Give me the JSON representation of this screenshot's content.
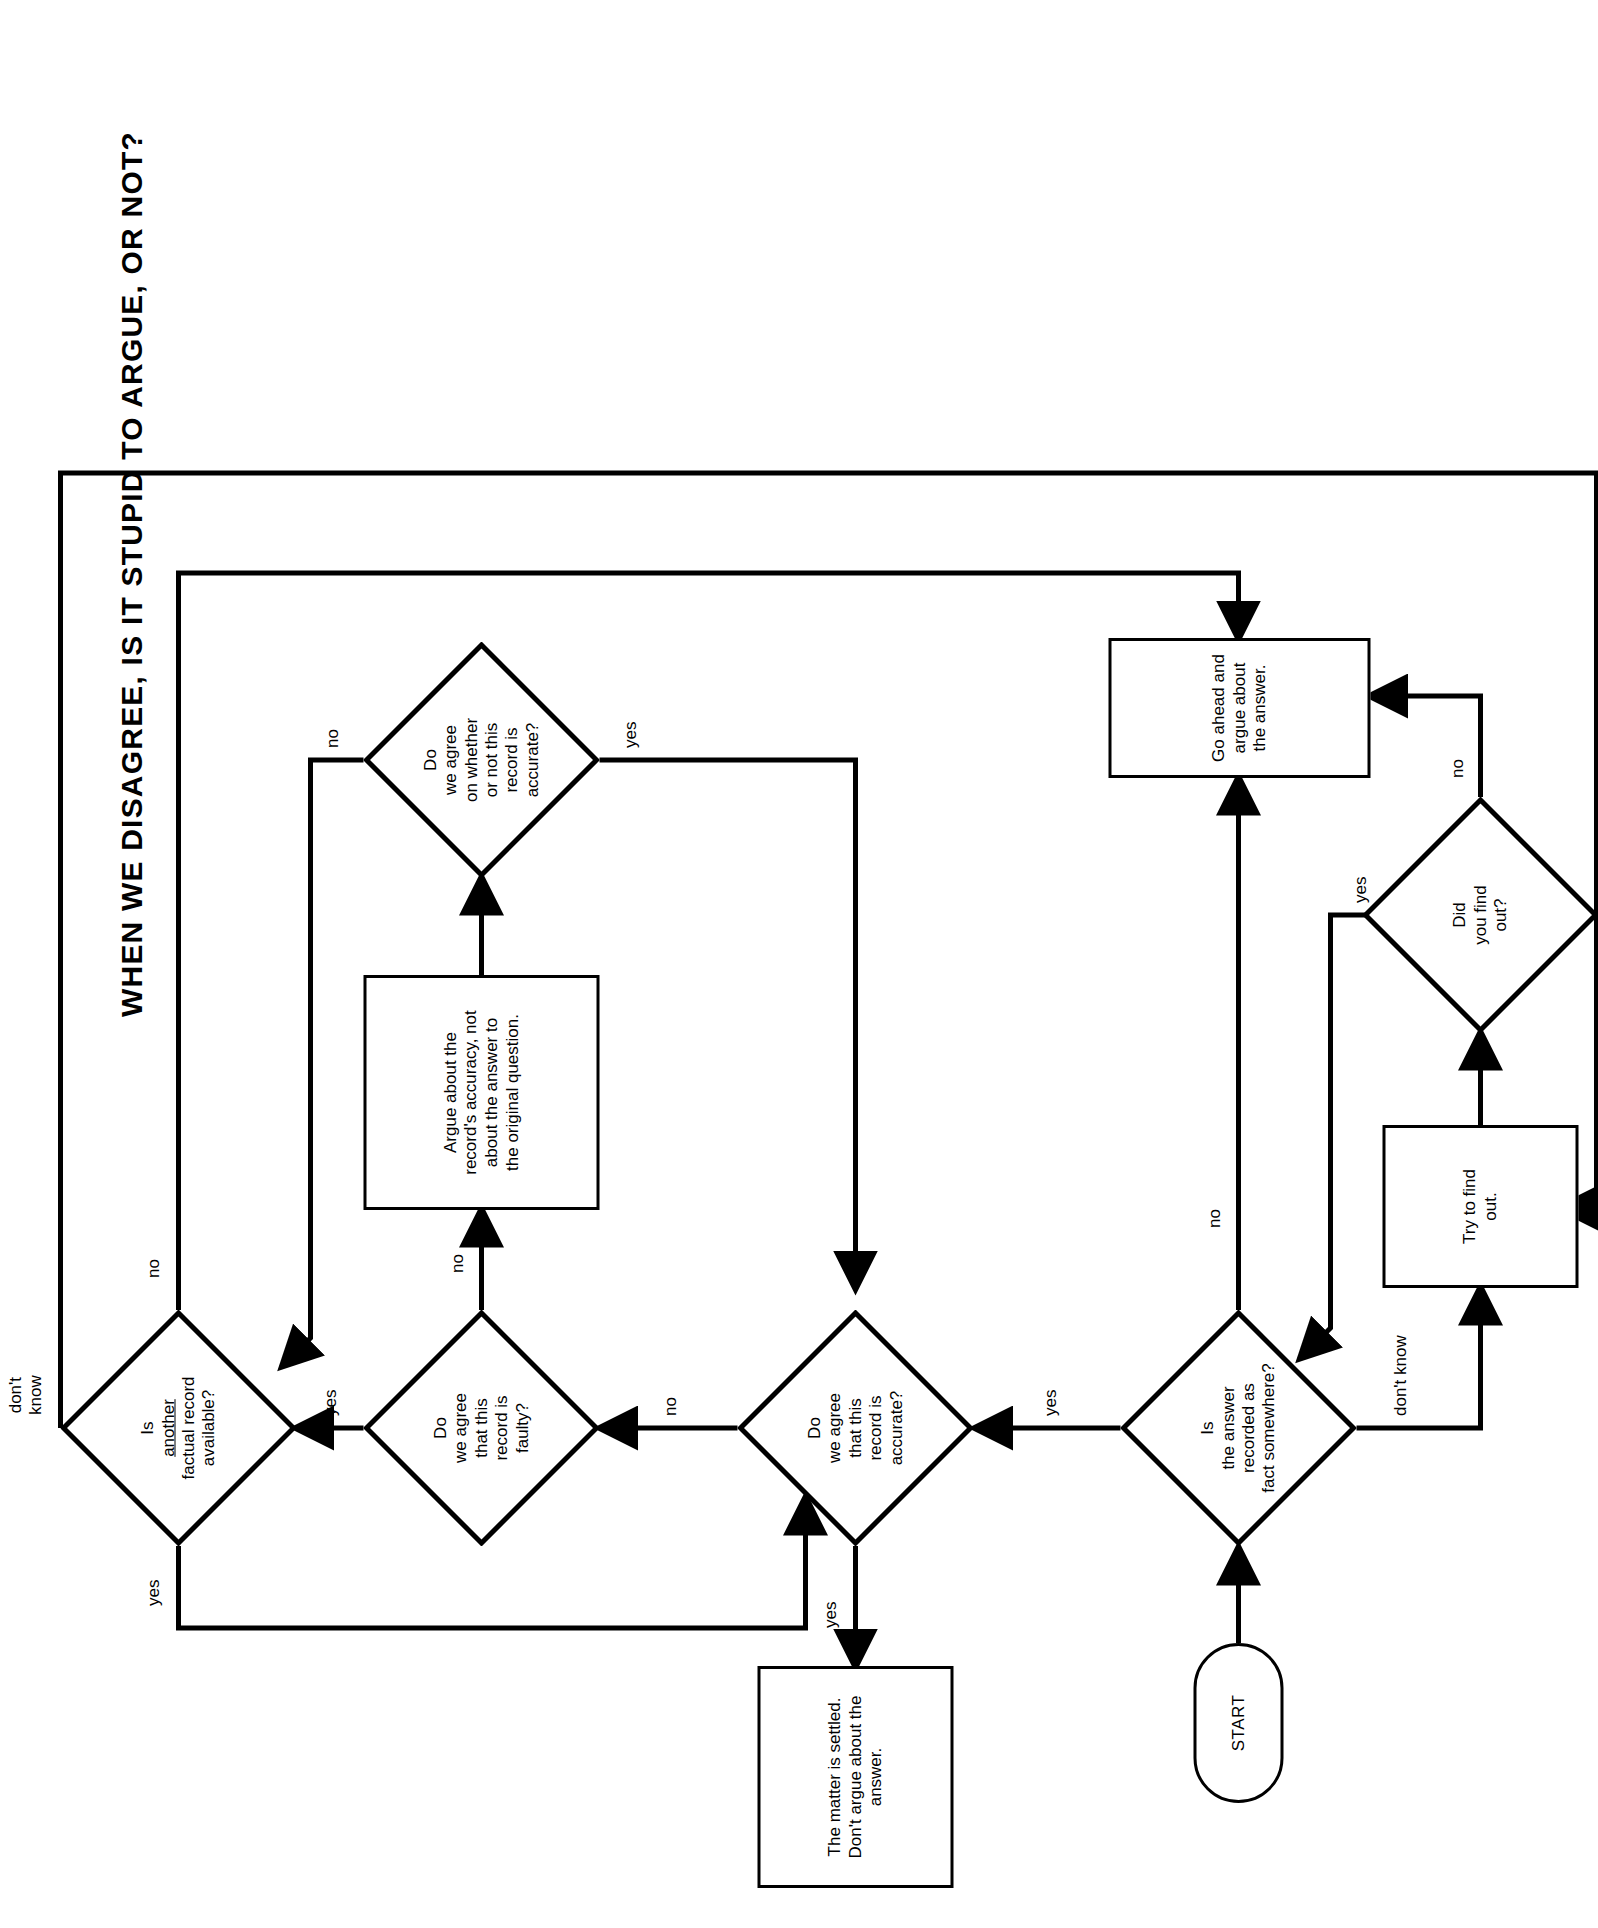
{
  "title": "WHEN WE DISAGREE,  IS IT  STUPID  TO  ARGUE, OR NOT?",
  "nodes": {
    "start": {
      "label": "START",
      "shape": "terminal"
    },
    "recorded": {
      "line1": "Is",
      "line2": "the answer",
      "line3": "recorded as",
      "line4": "fact somewhere?",
      "shape": "decision"
    },
    "try_find": {
      "line1": "Try to find",
      "line2": "out.",
      "shape": "process"
    },
    "did_find": {
      "line1": "Did",
      "line2": "you find",
      "line3": "out?",
      "shape": "decision"
    },
    "go_argue": {
      "line1": "Go ahead and",
      "line2": "argue about",
      "line3": "the answer.",
      "shape": "process"
    },
    "agree_accurate": {
      "line1": "Do",
      "line2": "we agree",
      "line3": "that this",
      "line4": "record is",
      "line5": "accurate?",
      "shape": "decision"
    },
    "settled": {
      "line1": "The matter is settled.",
      "line2": "Don't argue about the",
      "line3": "answer.",
      "shape": "process"
    },
    "agree_faulty": {
      "line1": "Do",
      "line2": "we agree",
      "line3": "that this",
      "line4": "record is",
      "line5": "faulty?",
      "shape": "decision"
    },
    "argue_accuracy": {
      "line1": "Argue about the",
      "line2": "record's accuracy, not",
      "line3": "about the answer to",
      "line4": "the original question.",
      "shape": "process"
    },
    "agree_whether": {
      "line1": "Do",
      "line2": "we agree",
      "line3": "on whether",
      "line4": "or not this",
      "line5": "record is",
      "line6": "accurate?",
      "shape": "decision"
    },
    "another_record": {
      "line1": "Is",
      "line2": "another",
      "line3": "factual record",
      "line4": "available?",
      "shape": "decision",
      "underline_line": 2
    }
  },
  "edge_labels": {
    "recorded_yes": "yes",
    "recorded_no": "no",
    "recorded_dontknow": "don't know",
    "didfind_yes": "yes",
    "didfind_no": "no",
    "accurate_yes": "yes",
    "accurate_no": "no",
    "faulty_yes": "yes",
    "faulty_no": "no",
    "whether_yes": "yes",
    "whether_no": "no",
    "another_yes": "yes",
    "another_no": "no",
    "another_dontknow": "don't\nknow"
  }
}
